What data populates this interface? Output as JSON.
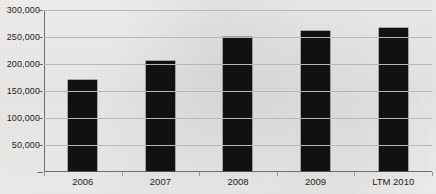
{
  "chart_data": {
    "type": "bar",
    "title": "",
    "title_note": "chart title is cropped off above the top edge of the scan and is not legible",
    "xlabel": "",
    "ylabel": "",
    "categories": [
      "2006",
      "2007",
      "2008",
      "2009",
      "LTM 2010"
    ],
    "values": [
      169000,
      205000,
      250000,
      260000,
      267000
    ],
    "series": [
      {
        "name": "",
        "values": [
          169000,
          205000,
          250000,
          260000,
          267000
        ]
      }
    ],
    "ylim": [
      0,
      300000
    ],
    "ytick_values": [
      0,
      50000,
      100000,
      150000,
      200000,
      250000,
      300000
    ],
    "ytick_labels": [
      "-",
      "50,000",
      "100,000",
      "150,000",
      "200,000",
      "250,000",
      "300,000"
    ],
    "grid": "horizontal",
    "legend": "none",
    "bar_color": "#111111",
    "gridline_color": "#b9b9b7",
    "axis_color": "#6f6f6d",
    "background_color": "#f2f1ef",
    "text_color": "#1d1d1d"
  }
}
